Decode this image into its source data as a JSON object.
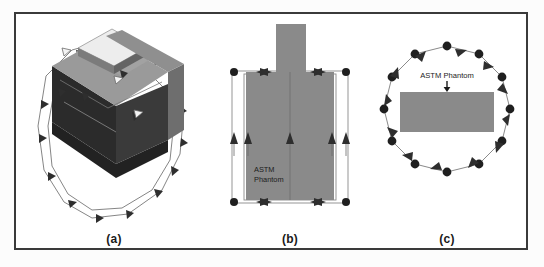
{
  "figure": {
    "panels": [
      {
        "id": "a",
        "caption": "(a)",
        "view": "3d-isometric",
        "label": "",
        "marker_count": 16,
        "description": "3D isometric view of ASTM phantom box with surrounding polygonal scan path and cone markers"
      },
      {
        "id": "b",
        "caption": "(b)",
        "view": "front-elevation",
        "label": "ASTM\nPhantom",
        "label_line1": "ASTM",
        "label_line2": "Phantom",
        "marker_count": 4,
        "description": "Front view of ASTM phantom with neck extension and rectangular scan path"
      },
      {
        "id": "c",
        "caption": "(c)",
        "view": "top-down",
        "label": "ASTM Phantom",
        "marker_count": 12,
        "description": "Top-down view of ASTM phantom rectangle inside dodecagonal scan path"
      }
    ],
    "colors": {
      "frame_border": "#3a3a3a",
      "background": "#ffffff",
      "phantom_fill": "#8a8a8a",
      "phantom_top_face": "#9a9a9a",
      "phantom_dark_face": "#2b2b2b",
      "phantom_side_face": "#6e6e6e",
      "path_line": "#6a6a6a",
      "marker": "#2e2e2e",
      "text": "#1b1b1b"
    }
  }
}
